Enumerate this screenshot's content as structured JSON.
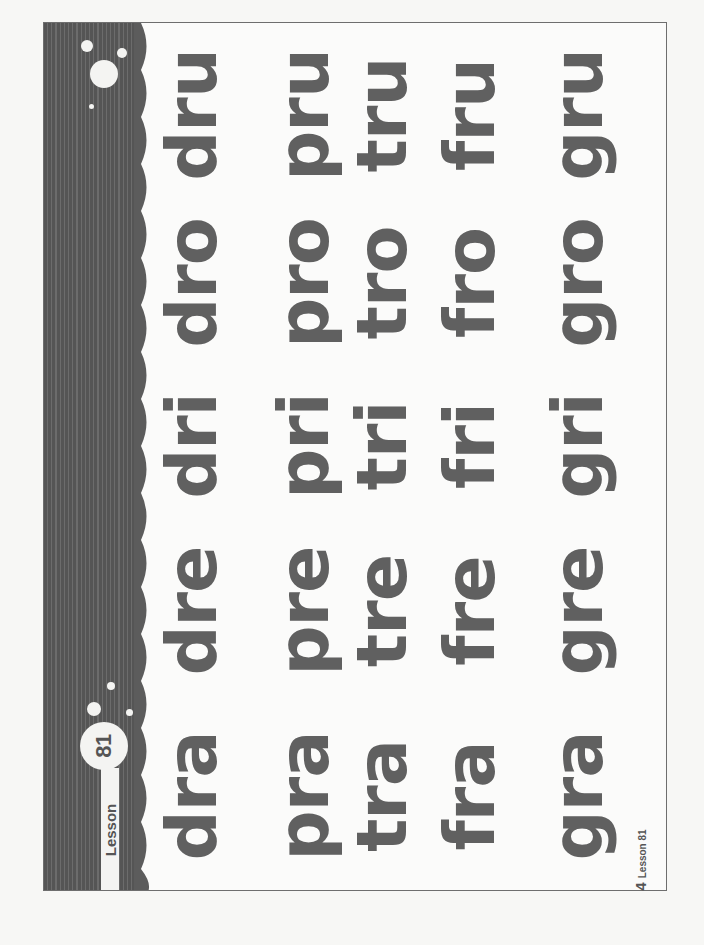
{
  "lesson": {
    "label": "Lesson",
    "number": "81"
  },
  "footer": {
    "page_number": "4",
    "lesson_text": "Lesson 81"
  },
  "colors": {
    "text": "#606060",
    "band": "#5a5a5a",
    "paper": "#fbfbfa"
  },
  "grid": {
    "rows": [
      {
        "words": [
          "dra",
          "dre",
          "dri",
          "dro",
          "dru"
        ]
      },
      {
        "words": [
          "pra",
          "pre",
          "pri",
          "pro",
          "pru"
        ]
      },
      {
        "words": [
          "tra",
          "tre",
          "tri",
          "tro",
          "tru"
        ]
      },
      {
        "words": [
          "fra",
          "fre",
          "fri",
          "fro",
          "fru"
        ]
      },
      {
        "words": [
          "gra",
          "gre",
          "gri",
          "gro",
          "gru"
        ]
      }
    ]
  }
}
